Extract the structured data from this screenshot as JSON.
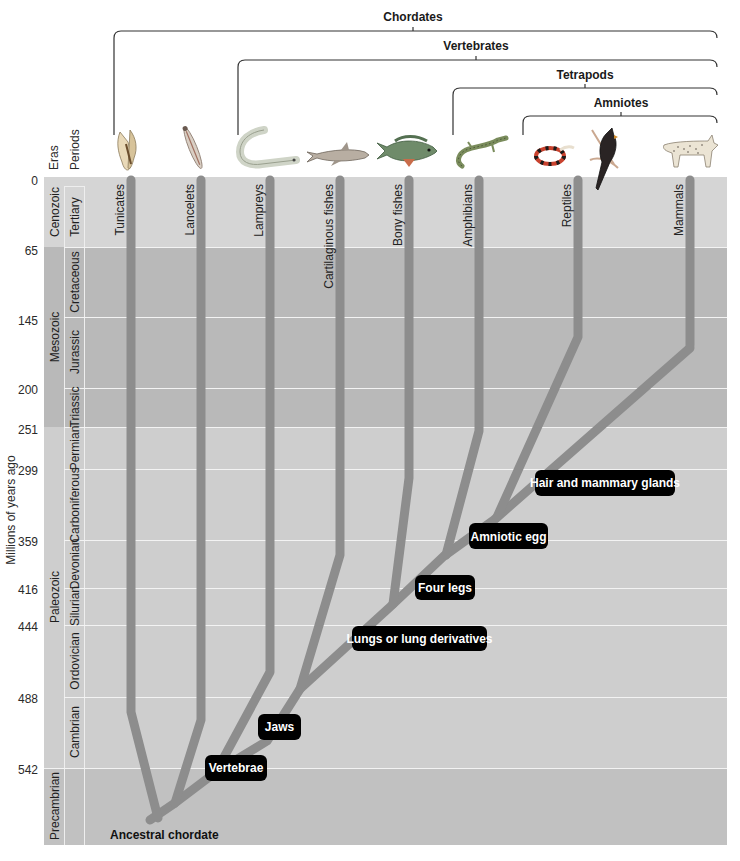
{
  "clades": [
    {
      "label": "Chordates"
    },
    {
      "label": "Vertebrates"
    },
    {
      "label": "Tetrapods"
    },
    {
      "label": "Amniotes"
    }
  ],
  "columns": {
    "eras": "Eras",
    "periods": "Periods"
  },
  "axis": {
    "title": "Millions of years ago"
  },
  "ticks": [
    "0",
    "65",
    "145",
    "200",
    "251",
    "299",
    "359",
    "416",
    "444",
    "488",
    "542"
  ],
  "eras": [
    {
      "label": "Cenozoic"
    },
    {
      "label": "Mesozoic"
    },
    {
      "label": "Paleozoic"
    },
    {
      "label": "Precambrian"
    }
  ],
  "periods": [
    {
      "label": "Tertiary"
    },
    {
      "label": "Cretaceous"
    },
    {
      "label": "Jurassic"
    },
    {
      "label": "Triassic"
    },
    {
      "label": "Permian"
    },
    {
      "label": "Carboniferous"
    },
    {
      "label": "Devonian"
    },
    {
      "label": "Silurian"
    },
    {
      "label": "Ordovician"
    },
    {
      "label": "Cambrian"
    }
  ],
  "taxa": [
    {
      "label": "Tunicates",
      "icon": "tunicate-icon"
    },
    {
      "label": "Lancelets",
      "icon": "lancelet-icon"
    },
    {
      "label": "Lampreys",
      "icon": "lamprey-icon"
    },
    {
      "label": "Cartilaginous fishes",
      "icon": "shark-icon"
    },
    {
      "label": "Bony fishes",
      "icon": "bony-fish-icon"
    },
    {
      "label": "Amphibians",
      "icon": "salamander-icon"
    },
    {
      "label": "Reptiles",
      "icon": "snake-icon"
    },
    {
      "label": "Mammals",
      "icon": "bobcat-icon"
    }
  ],
  "extra_icons": [
    "cardinal-bird-icon"
  ],
  "traits": [
    {
      "label": "Vertebrae"
    },
    {
      "label": "Jaws"
    },
    {
      "label": "Lungs or lung derivatives"
    },
    {
      "label": "Four legs"
    },
    {
      "label": "Amniotic egg"
    },
    {
      "label": "Hair and mammary glands"
    }
  ],
  "root": {
    "label": "Ancestral chordate"
  },
  "colors": {
    "cenozoic_band": "#d4d4d4",
    "mesozoic_band": "#b9b9b9",
    "paleozoic_band": "#cdcdcd",
    "precambrian_band": "#c0c0c0",
    "branch": "#8e8e8e",
    "trait_box": "#000000",
    "gridline": "#f2f2f2"
  }
}
